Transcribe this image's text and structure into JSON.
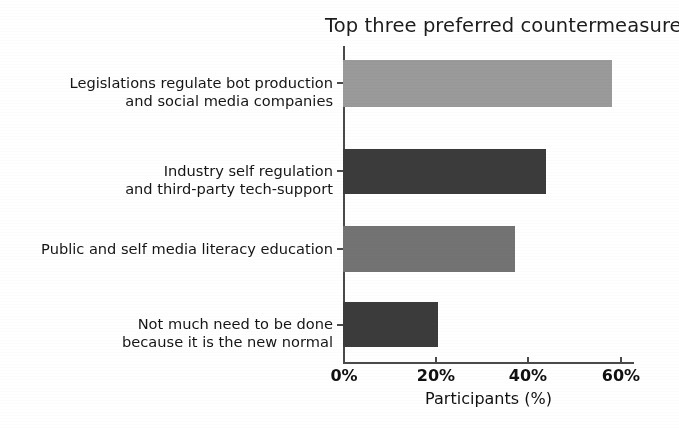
{
  "chart_data": {
    "type": "bar",
    "orientation": "horizontal",
    "title": "Top three preferred countermeasures",
    "xlabel": "Participants (%)",
    "ylabel": "",
    "categories": [
      "Legislations regulate bot production\nand social media companies",
      "Industry self regulation\nand third-party tech-support",
      "Public and self media literacy education",
      "Not much need to be done\nbecause it is the new normal"
    ],
    "category_lines": [
      [
        "Legislations regulate bot production",
        "and social media companies"
      ],
      [
        "Industry self regulation",
        "and third-party tech-support"
      ],
      [
        "Public and self media literacy education"
      ],
      [
        "Not much need to be done",
        "because it is the new normal"
      ]
    ],
    "values": [
      61,
      46,
      39,
      21.5
    ],
    "bar_colors": [
      "#9a9a9a",
      "#3b3b3b",
      "#737373",
      "#3b3b3b"
    ],
    "xlim": [
      0,
      66
    ],
    "xticks": [
      0,
      20,
      40,
      60
    ],
    "xtick_labels": [
      "0%",
      "20%",
      "40%",
      "60%"
    ],
    "grid": false,
    "legend": null
  },
  "axis": {
    "x_title": "Participants (%)",
    "tick_labels": [
      "0%",
      "20%",
      "40%",
      "60%"
    ]
  },
  "header": {
    "title": "Top three preferred countermeasures"
  }
}
